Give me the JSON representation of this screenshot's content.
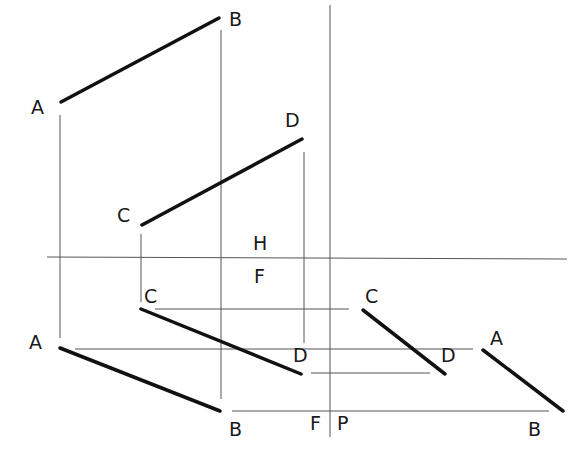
{
  "diagram": {
    "title": "",
    "folding_lines": {
      "horizontal_H_F": {
        "x1": 47,
        "y1": 257,
        "x2": 567,
        "y2": 259
      },
      "vertical_F_P": {
        "x1": 330,
        "y1": 5,
        "x2": 330,
        "y2": 437
      }
    },
    "plane_labels": {
      "H": {
        "text": "H",
        "x": 253,
        "y": 250
      },
      "F_top": {
        "text": "F",
        "x": 254,
        "y": 283
      },
      "F_bottom": {
        "text": "F",
        "x": 310,
        "y": 430
      },
      "P": {
        "text": "P",
        "x": 337,
        "y": 430
      }
    },
    "views": {
      "top_view": {
        "lines": [
          {
            "name": "AB",
            "x1": 61,
            "y1": 102,
            "x2": 219,
            "y2": 18
          },
          {
            "name": "CD",
            "x1": 142,
            "y1": 225,
            "x2": 302,
            "y2": 139
          }
        ],
        "labels": [
          {
            "text": "A",
            "x": 31,
            "y": 114
          },
          {
            "text": "B",
            "x": 229,
            "y": 26
          },
          {
            "text": "C",
            "x": 117,
            "y": 222
          },
          {
            "text": "D",
            "x": 285,
            "y": 127
          }
        ]
      },
      "front_view": {
        "lines": [
          {
            "name": "CD",
            "x1": 141,
            "y1": 309,
            "x2": 301,
            "y2": 374
          },
          {
            "name": "AB",
            "x1": 60,
            "y1": 348,
            "x2": 220,
            "y2": 411
          }
        ],
        "labels": [
          {
            "text": "C",
            "x": 144,
            "y": 303
          },
          {
            "text": "D",
            "x": 293,
            "y": 362
          },
          {
            "text": "A",
            "x": 29,
            "y": 349
          },
          {
            "text": "B",
            "x": 229,
            "y": 436
          }
        ]
      },
      "profile_view": {
        "lines": [
          {
            "name": "CD",
            "x1": 363,
            "y1": 310,
            "x2": 445,
            "y2": 374
          },
          {
            "name": "AB",
            "x1": 483,
            "y1": 350,
            "x2": 563,
            "y2": 411
          }
        ],
        "labels": [
          {
            "text": "C",
            "x": 365,
            "y": 303
          },
          {
            "text": "D",
            "x": 441,
            "y": 362
          },
          {
            "text": "A",
            "x": 490,
            "y": 345
          },
          {
            "text": "B",
            "x": 528,
            "y": 436
          }
        ]
      }
    },
    "projection_lines": [
      {
        "x1": 60,
        "y1": 115,
        "x2": 60,
        "y2": 338
      },
      {
        "x1": 221,
        "y1": 30,
        "x2": 221,
        "y2": 399
      },
      {
        "x1": 141,
        "y1": 234,
        "x2": 141,
        "y2": 302
      },
      {
        "x1": 304,
        "y1": 152,
        "x2": 304,
        "y2": 343
      },
      {
        "x1": 155,
        "y1": 309,
        "x2": 349,
        "y2": 309
      },
      {
        "x1": 75,
        "y1": 349,
        "x2": 473,
        "y2": 349
      },
      {
        "x1": 311,
        "y1": 373,
        "x2": 430,
        "y2": 373
      },
      {
        "x1": 232,
        "y1": 411,
        "x2": 549,
        "y2": 411
      }
    ]
  }
}
